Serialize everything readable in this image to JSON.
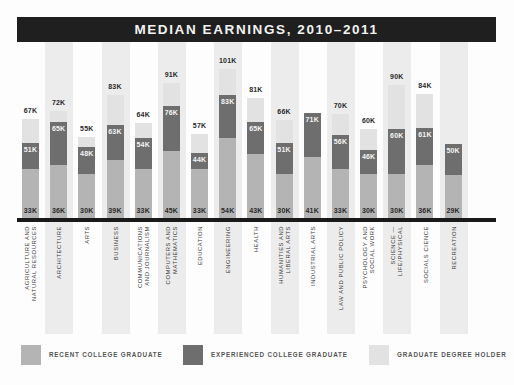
{
  "chart_data": {
    "type": "bar",
    "title": "MEDIAN EARNINGS, 2010–2011",
    "xlabel": "",
    "ylabel": "",
    "grid": false,
    "legend_position": "bottom",
    "categories": [
      "AGRICULTURE AND NATURAL RESOURCES",
      "ARCHITECTURE",
      "ARTS",
      "BUSINESS",
      "COMMUNICATIONS AND JOURNALISM",
      "COMPUTERS AND MATHEMATICS",
      "EDUCATION",
      "ENGINEERING",
      "HEALTH",
      "HUMANITIES AND LIBERAL ARTS",
      "INDUSTRIAL ARTS",
      "LAW AND PUBLIC POLICY",
      "PSYCHOLOGY AND SOCIAL WORK",
      "SCIENCE — LIFE/PHYSICAL",
      "SOCIALS CIENCE",
      "RECREATION"
    ],
    "series": [
      {
        "name": "RECENT COLLEGE GRADUATE",
        "color": "#b4b4b4",
        "values": [
          33,
          36,
          30,
          39,
          33,
          45,
          33,
          54,
          43,
          30,
          41,
          33,
          30,
          30,
          36,
          29
        ]
      },
      {
        "name": "EXPERIENCED COLLEGE GRADUATE",
        "color": "#6e6e6e",
        "values": [
          51,
          65,
          48,
          63,
          54,
          76,
          44,
          83,
          65,
          51,
          71,
          56,
          46,
          60,
          61,
          50
        ]
      },
      {
        "name": "GRADUATE DEGREE HOLDER",
        "color": "#e2e2e2",
        "values": [
          67,
          72,
          55,
          83,
          64,
          91,
          57,
          101,
          81,
          66,
          null,
          70,
          60,
          90,
          84,
          null
        ]
      }
    ],
    "units": "thousands USD"
  },
  "title": "MEDIAN EARNINGS, 2010–2011",
  "columns": [
    {
      "cat": "AGRICULTURE AND\nNATURAL RESOURCES",
      "rec": "33K",
      "exp": "51K",
      "grad": "67K",
      "r": 33,
      "e": 51,
      "g": 67
    },
    {
      "cat": "ARCHITECTURE",
      "rec": "36K",
      "exp": "65K",
      "grad": "72K",
      "r": 36,
      "e": 65,
      "g": 72
    },
    {
      "cat": "ARTS",
      "rec": "30K",
      "exp": "48K",
      "grad": "55K",
      "r": 30,
      "e": 48,
      "g": 55
    },
    {
      "cat": "BUSINESS",
      "rec": "39K",
      "exp": "63K",
      "grad": "83K",
      "r": 39,
      "e": 63,
      "g": 83
    },
    {
      "cat": "COMMUNICATIONS\nAND JOURNALISM",
      "rec": "33K",
      "exp": "54K",
      "grad": "64K",
      "r": 33,
      "e": 54,
      "g": 64
    },
    {
      "cat": "COMPUTERS AND\nMATHEMATICS",
      "rec": "45K",
      "exp": "76K",
      "grad": "91K",
      "r": 45,
      "e": 76,
      "g": 91
    },
    {
      "cat": "EDUCATION",
      "rec": "33K",
      "exp": "44K",
      "grad": "57K",
      "r": 33,
      "e": 44,
      "g": 57
    },
    {
      "cat": "ENGINEERING",
      "rec": "54K",
      "exp": "83K",
      "grad": "101K",
      "r": 54,
      "e": 83,
      "g": 101
    },
    {
      "cat": "HEALTH",
      "rec": "43K",
      "exp": "65K",
      "grad": "81K",
      "r": 43,
      "e": 65,
      "g": 81
    },
    {
      "cat": "HUMANITIES AND\nLIBERAL ARTS",
      "rec": "30K",
      "exp": "51K",
      "grad": "66K",
      "r": 30,
      "e": 51,
      "g": 66
    },
    {
      "cat": "INDUSTRIAL ARTS",
      "rec": "41K",
      "exp": "71K",
      "grad": "",
      "r": 41,
      "e": 71,
      "g": 0
    },
    {
      "cat": "LAW AND PUBLIC POLICY",
      "rec": "33K",
      "exp": "56K",
      "grad": "70K",
      "r": 33,
      "e": 56,
      "g": 70
    },
    {
      "cat": "PSYCHOLOGY AND\nSOCIAL WORK",
      "rec": "30K",
      "exp": "46K",
      "grad": "60K",
      "r": 30,
      "e": 46,
      "g": 60
    },
    {
      "cat": "SCIENCE —\nLIFE/PHYSICAL",
      "rec": "30K",
      "exp": "60K",
      "grad": "90K",
      "r": 30,
      "e": 60,
      "g": 90
    },
    {
      "cat": "SOCIALS CIENCE",
      "rec": "36K",
      "exp": "61K",
      "grad": "84K",
      "r": 36,
      "e": 61,
      "g": 84
    },
    {
      "cat": "RECREATION",
      "rec": "29K",
      "exp": "50K",
      "grad": "",
      "r": 29,
      "e": 50,
      "g": 0
    }
  ],
  "legend": [
    {
      "label": "RECENT COLLEGE GRADUATE",
      "color": "#b4b4b4"
    },
    {
      "label": "EXPERIENCED COLLEGE GRADUATE",
      "color": "#6e6e6e"
    },
    {
      "label": "GRADUATE DEGREE HOLDER",
      "color": "#e2e2e2"
    }
  ]
}
